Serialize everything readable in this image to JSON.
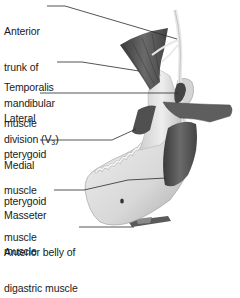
{
  "diagram": {
    "labels": [
      {
        "id": "anterior-trunk",
        "lines": [
          "Anterior",
          "trunk of",
          "mandibular",
          "division (V"
        ],
        "subscript": "3",
        "suffix": ")"
      },
      {
        "id": "temporalis",
        "lines": [
          "Temporalis",
          "muscle"
        ]
      },
      {
        "id": "lateral-pterygoid",
        "lines": [
          "Lateral",
          "pterygoid",
          "muscle"
        ]
      },
      {
        "id": "medial-pterygoid",
        "lines": [
          "Medial",
          "pterygoid",
          "muscle"
        ]
      },
      {
        "id": "masseter",
        "lines": [
          "Masseter",
          "muscle"
        ]
      },
      {
        "id": "anterior-belly-digastric",
        "lines": [
          "Anterior belly of",
          "digastric muscle"
        ]
      }
    ],
    "colors": {
      "leader_line": "#2a2a2a",
      "text": "#1a1a1a",
      "bone_light": "#e6e6e6",
      "muscle_dark": "#4a4a4a",
      "nerve": "#f2f2f2"
    }
  }
}
